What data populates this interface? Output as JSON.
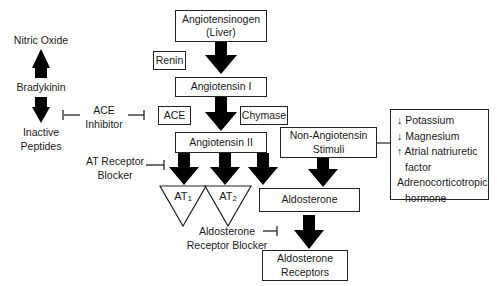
{
  "diagram": {
    "nodes": {
      "angiotensinogen": "Angiotensinogen",
      "angiotensinogen_source": "(Liver)",
      "renin": "Renin",
      "angiotensin_1": "Angiotensin I",
      "ace": "ACE",
      "chymase": "Chymase",
      "angiotensin_2": "Angiotensin II",
      "non_angiotensin_1": "Non-Angiotensin",
      "non_angiotensin_2": "Stimuli",
      "at1_main": "AT",
      "at1_sub": "1",
      "at2_main": "AT",
      "at2_sub": "2",
      "aldosterone": "Aldosterone",
      "aldosterone_receptors_1": "Aldosterone",
      "aldosterone_receptors_2": "Receptors"
    },
    "left_branch": {
      "nitric_oxide": "Nitric Oxide",
      "bradykinin": "Bradykinin",
      "inactive_peptides_1": "Inactive",
      "inactive_peptides_2": "Peptides"
    },
    "inhibitors": {
      "ace_inhibitor_1": "ACE",
      "ace_inhibitor_2": "Inhibitor",
      "at_blocker_1": "AT Receptor",
      "at_blocker_2": "Blocker",
      "aldo_blocker_1": "Aldosterone",
      "aldo_blocker_2": "Receptor Blocker"
    },
    "stimuli_list": [
      {
        "arrow": "↓",
        "label": "Potassium"
      },
      {
        "arrow": "↓",
        "label": "Magnesium"
      },
      {
        "arrow": "↑",
        "label": "Atrial natriuretic"
      },
      {
        "arrow": "",
        "label": "factor"
      },
      {
        "arrow": "",
        "label": "Adrenocorticotropic"
      },
      {
        "arrow": "",
        "label": "hormone"
      }
    ],
    "colors": {
      "arrow": "#000000",
      "border": "#222222",
      "text": "#1a1a1a"
    }
  }
}
